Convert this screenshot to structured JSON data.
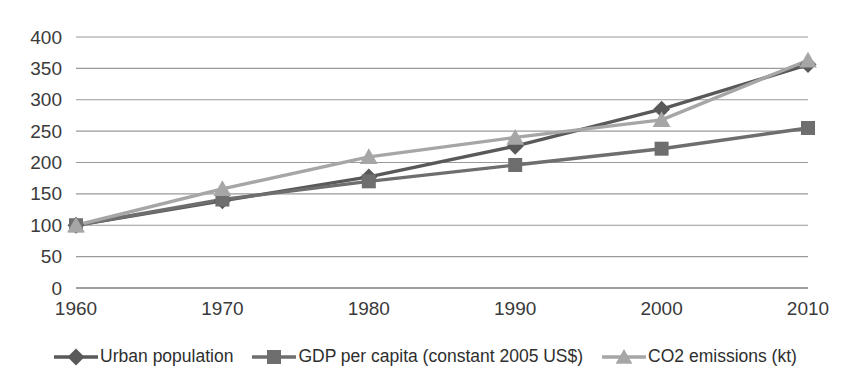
{
  "chart_data": {
    "type": "line",
    "title": "",
    "subtitle": "",
    "xlabel": "",
    "ylabel": "",
    "x": [
      1960,
      1970,
      1980,
      1990,
      2000,
      2010
    ],
    "categories": [
      "1960",
      "1970",
      "1980",
      "1990",
      "2000",
      "2010"
    ],
    "xlim": [
      1960,
      2010
    ],
    "ylim": [
      0,
      400
    ],
    "ytick_labels": [
      "400",
      "350",
      "300",
      "250",
      "200",
      "150",
      "100",
      "50",
      "0"
    ],
    "ytick_values": [
      400,
      350,
      300,
      250,
      200,
      150,
      100,
      50,
      0
    ],
    "ytick_step": 50,
    "grid": "horizontal",
    "legend_position": "bottom",
    "series": [
      {
        "name": "Urban population",
        "marker": "diamond",
        "color": "#595959",
        "values": [
          100,
          139,
          177,
          226,
          285,
          356
        ]
      },
      {
        "name": "GDP per capita (constant 2005 US$)",
        "marker": "square",
        "color": "#6e6e6e",
        "values": [
          100,
          141,
          170,
          196,
          222,
          255
        ]
      },
      {
        "name": "CO2 emissions (kt)",
        "marker": "triangle",
        "color": "#a6a6a6",
        "values": [
          100,
          158,
          209,
          240,
          268,
          363
        ]
      }
    ]
  },
  "legend": {
    "items": [
      {
        "label": "Urban population",
        "marker": "diamond-marker",
        "color": "#595959"
      },
      {
        "label": "GDP per capita (constant 2005 US$)",
        "marker": "square-marker",
        "color": "#6e6e6e"
      },
      {
        "label": "CO2 emissions (kt)",
        "marker": "triangle-marker",
        "color": "#a6a6a6"
      }
    ]
  }
}
